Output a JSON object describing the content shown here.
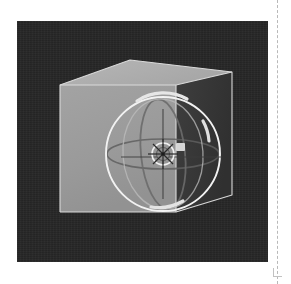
{
  "app": {
    "title": "3D viewport",
    "page_guide_label": "page-margin-guide"
  },
  "viewport": {
    "background_color": "#262626",
    "bounds": {
      "x": 17,
      "y": 21,
      "width": 251,
      "height": 241
    }
  },
  "scene": {
    "object_name": "cube",
    "object_label": "Cube",
    "shading": "solid",
    "cube": {
      "face_front_color": "#9a9a9a",
      "face_top_color": "#b0b0b0",
      "face_right_color": "#3a3a3a",
      "edge_color": "#d8d8d8",
      "vertices": {
        "front_top_left": [
          43,
          64
        ],
        "front_top_right": [
          159,
          64
        ],
        "front_bottom_left": [
          43,
          191
        ],
        "front_bottom_right": [
          159,
          191
        ],
        "back_top_left": [
          113,
          39
        ],
        "back_top_right": [
          215,
          51
        ],
        "back_bottom_right": [
          215,
          174
        ]
      }
    },
    "gizmo": {
      "type": "rotate-gizmo",
      "center": [
        146,
        133
      ],
      "outer_radius": 57,
      "outer_ring_color": "#f2f2f2",
      "trackball_ring_color": "#e8e8e8",
      "x_axis_ring_color": "#555555",
      "y_axis_ring_color": "#cccccc",
      "z_axis_ring_color": "#6a6a6a",
      "pivot_color": "#f5f5f5",
      "handle_color": "#dddddd",
      "arrow_handles": [
        {
          "name": "rotate-handle-top",
          "x": 150,
          "y": 78
        },
        {
          "name": "rotate-handle-right",
          "x": 188,
          "y": 110
        },
        {
          "name": "rotate-handle-bottom",
          "x": 153,
          "y": 184
        }
      ]
    }
  }
}
